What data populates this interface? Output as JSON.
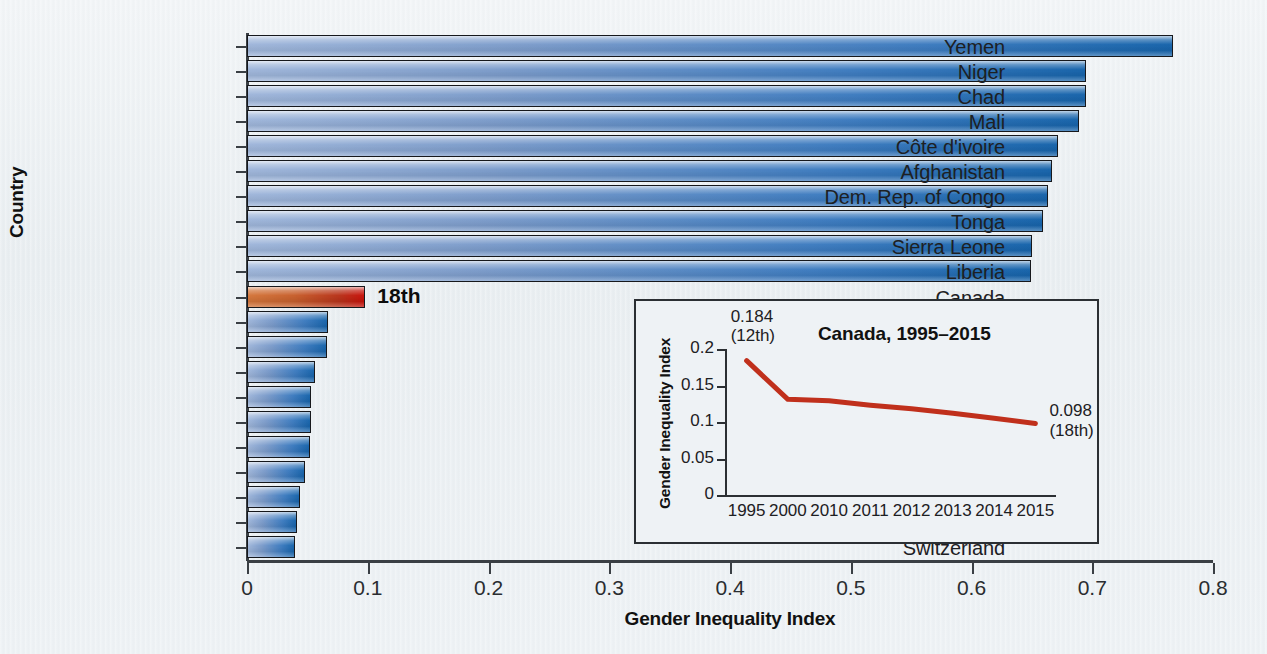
{
  "chart_data": {
    "type": "bar",
    "orientation": "horizontal",
    "title": "",
    "xlabel": "Gender Inequality Index",
    "ylabel": "Country",
    "xlim": [
      0,
      0.8
    ],
    "xticks": [
      "0",
      "0.1",
      "0.2",
      "0.3",
      "0.4",
      "0.5",
      "0.6",
      "0.7",
      "0.8"
    ],
    "xtick_values": [
      0,
      0.1,
      0.2,
      0.3,
      0.4,
      0.5,
      0.6,
      0.7,
      0.8
    ],
    "grid": false,
    "legend": "none",
    "categories": [
      "Yemen",
      "Niger",
      "Chad",
      "Mali",
      "Côte d'ivoire",
      "Afghanistan",
      "Dem. Rep. of Congo",
      "Tonga",
      "Sierra Leone",
      "Liberia",
      "Canada",
      "Republic of Korea",
      "Germany",
      "Finland",
      "Slovenia",
      "Norway",
      "Iceland",
      "Sweden",
      "Netherlands",
      "Denmark",
      "Switzerland"
    ],
    "values": [
      0.767,
      0.695,
      0.695,
      0.689,
      0.672,
      0.667,
      0.663,
      0.659,
      0.65,
      0.649,
      0.098,
      0.067,
      0.066,
      0.056,
      0.053,
      0.053,
      0.052,
      0.048,
      0.044,
      0.041,
      0.04
    ],
    "highlight_category": "Canada",
    "highlight_color": "#bc3a20",
    "bar_color": "#2f72b8",
    "annotations": [
      {
        "category": "Canada",
        "text": "18th"
      }
    ]
  },
  "inset_chart_data": {
    "type": "line",
    "title": "Canada, 1995–2015",
    "xlabel": "",
    "ylabel": "Gender Inequality Index",
    "ylim": [
      0,
      0.2
    ],
    "yticks": [
      "0",
      "0.05",
      "0.1",
      "0.15",
      "0.2"
    ],
    "ytick_values": [
      0,
      0.05,
      0.1,
      0.15,
      0.2
    ],
    "categories": [
      "1995",
      "2000",
      "2010",
      "2011",
      "2012",
      "2013",
      "2014",
      "2015"
    ],
    "values": [
      0.184,
      0.131,
      0.129,
      0.123,
      0.118,
      0.112,
      0.105,
      0.098
    ],
    "line_color": "#c0301c",
    "grid": false,
    "legend": "none",
    "annotations": [
      {
        "at": "1995",
        "value": "0.184",
        "rank": "(12th)"
      },
      {
        "at": "2015",
        "value": "0.098",
        "rank": "(18th)"
      }
    ]
  },
  "figure": {
    "background_color": "#eef2f5",
    "axis_color": "#3a3f44"
  }
}
